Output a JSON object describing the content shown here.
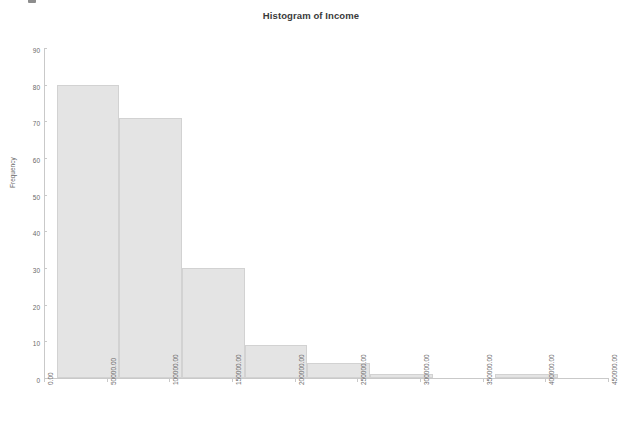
{
  "chart_data": {
    "type": "bar",
    "title": "Histogram of Income",
    "xlabel": "",
    "ylabel": "Frequency",
    "grid": false,
    "legend": false,
    "xlim": [
      0,
      450000
    ],
    "ylim": [
      0,
      90
    ],
    "bin_width": 50000,
    "x_tick_labels": [
      "0.00",
      "50000.00",
      "100000.00",
      "150000.00",
      "200000.00",
      "250000.00",
      "300000.00",
      "350000.00",
      "400000.00",
      "450000.00"
    ],
    "x_tick_values": [
      0,
      50000,
      100000,
      150000,
      200000,
      250000,
      300000,
      350000,
      400000,
      450000
    ],
    "y_tick_labels": [
      "0",
      "10",
      "20",
      "30",
      "40",
      "50",
      "60",
      "70",
      "80",
      "90"
    ],
    "y_tick_values": [
      0,
      10,
      20,
      30,
      40,
      50,
      60,
      70,
      80,
      90
    ],
    "bins": [
      {
        "start": 10000,
        "end": 60000,
        "value": 80
      },
      {
        "start": 60000,
        "end": 110000,
        "value": 71
      },
      {
        "start": 110000,
        "end": 160000,
        "value": 30
      },
      {
        "start": 160000,
        "end": 210000,
        "value": 9
      },
      {
        "start": 210000,
        "end": 260000,
        "value": 4
      },
      {
        "start": 260000,
        "end": 310000,
        "value": 1
      },
      {
        "start": 360000,
        "end": 410000,
        "value": 1
      }
    ],
    "colors": {
      "bar_fill": "#e4e4e4",
      "bar_border": "#d2d2d2",
      "axis": "#c9c9c9",
      "tick_text": "#6a6a6a",
      "title_text": "#3a3a3a",
      "background": "#ffffff"
    }
  }
}
